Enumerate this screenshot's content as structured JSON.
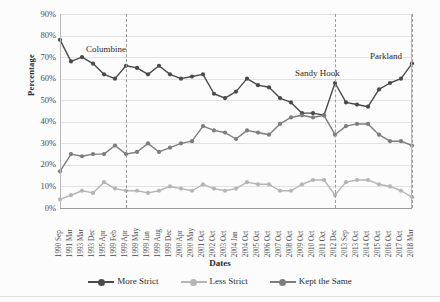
{
  "chart_data": {
    "type": "line",
    "title": "",
    "xlabel": "Dates",
    "ylabel": "Percentage",
    "ylim": [
      0,
      90
    ],
    "ytick_labels": [
      "0%",
      "10%",
      "20%",
      "30%",
      "40%",
      "50%",
      "60%",
      "70%",
      "80%",
      "90%"
    ],
    "ytick_values": [
      0,
      10,
      20,
      30,
      40,
      50,
      60,
      70,
      80,
      90
    ],
    "grid": true,
    "legend_position": "bottom",
    "categories": [
      "1990 Sep",
      "1991 Mar",
      "1993 Mar",
      "1993 Dec",
      "1995 Apr",
      "1999 Feb",
      "1999 Apr",
      "1999 May",
      "1999 Jun",
      "1999 Aug",
      "1999 Dec",
      "2000 Apr",
      "2000 May",
      "2001 Oct",
      "2002 Oct",
      "2003 Oct",
      "2004 Jan",
      "2004 Oct",
      "2005 Oct",
      "2006 Oct",
      "2007 Oct",
      "2008 Oct",
      "2009 Oct",
      "2010 Oct",
      "2011 Oct",
      "2012 Dec",
      "2013 Sep",
      "2013 Oct",
      "2014 Oct",
      "2015 Oct",
      "2016 Oct",
      "2017 Oct",
      "2018 Mar"
    ],
    "series": [
      {
        "name": "More Strict",
        "color": "#4a4a4a",
        "values": [
          78,
          68,
          70,
          67,
          62,
          60,
          66,
          65,
          62,
          66,
          62,
          60,
          61,
          62,
          53,
          51,
          54,
          60,
          57,
          56,
          51,
          49,
          44,
          44,
          43,
          58,
          49,
          48,
          47,
          55,
          58,
          60,
          67
        ]
      },
      {
        "name": "Less Strict",
        "color": "#b5b5b5",
        "values": [
          4,
          6,
          8,
          7,
          12,
          9,
          8,
          8,
          7,
          8,
          10,
          9,
          8,
          11,
          9,
          8,
          9,
          12,
          11,
          11,
          8,
          8,
          11,
          13,
          13,
          6,
          12,
          13,
          13,
          11,
          10,
          8,
          5
        ]
      },
      {
        "name": "Kept the Same",
        "color": "#7d7d7d",
        "values": [
          17,
          25,
          24,
          25,
          25,
          29,
          25,
          26,
          30,
          26,
          28,
          30,
          31,
          38,
          36,
          35,
          32,
          36,
          35,
          34,
          39,
          42,
          43,
          42,
          43,
          34,
          38,
          39,
          39,
          34,
          31,
          31,
          29
        ]
      }
    ],
    "annotations": [
      {
        "label": "Columbine",
        "category": "1999 Apr"
      },
      {
        "label": "Sandy Hook",
        "category": "2012 Dec"
      },
      {
        "label": "Parkland",
        "category": "2018 Mar"
      }
    ]
  },
  "legend": {
    "items": [
      {
        "label": "More Strict"
      },
      {
        "label": "Less Strict"
      },
      {
        "label": "Kept the Same"
      }
    ]
  }
}
